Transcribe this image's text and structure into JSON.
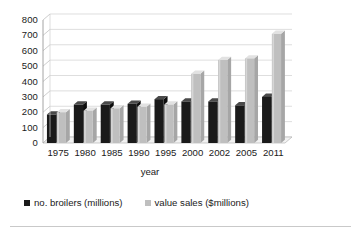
{
  "chart_data": {
    "type": "bar",
    "title": "",
    "subtitle": "",
    "xlabel": "year",
    "ylabel": "",
    "categories": [
      "1975",
      "1980",
      "1985",
      "1990",
      "1995",
      "2000",
      "2002",
      "2005",
      "2011"
    ],
    "series": [
      {
        "name": "no. broilers (millions)",
        "color": "#1a1a1a",
        "values": [
          185,
          250,
          250,
          255,
          285,
          270,
          270,
          245,
          300
        ]
      },
      {
        "name": "value sales ($millions)",
        "color": "#bfbfbf",
        "values": [
          200,
          210,
          225,
          235,
          250,
          450,
          540,
          550,
          710
        ]
      }
    ],
    "ylim": [
      0,
      800
    ],
    "ytick_step": 100,
    "yticks": [
      "800",
      "700",
      "600",
      "500",
      "400",
      "300",
      "200",
      "100",
      "0"
    ],
    "grid": true,
    "grid_axis": "y",
    "legend_position": "bottom-left",
    "style": "3d-perspective-column",
    "plot_background": "#ffffff",
    "grid_color": "#d0d0d0"
  },
  "legend": {
    "items": [
      {
        "label": "no. broilers (millions)",
        "color": "#1a1a1a"
      },
      {
        "label": "value sales ($millions)",
        "color": "#bfbfbf"
      }
    ]
  }
}
